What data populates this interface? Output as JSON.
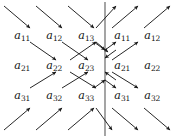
{
  "figure": {
    "width": 178,
    "height": 138,
    "background": "#ffffff",
    "ink": "#111111",
    "mirror_line_color": "#5a5a5a",
    "arrow_color": "#1a1a1a"
  },
  "mirror_line": {
    "name": "vertical mirror axis",
    "x": 105,
    "y_top": 2,
    "y_bottom": 136
  },
  "grid": {
    "column_x": [
      22,
      54,
      86,
      122,
      152
    ],
    "row_y": [
      35,
      65,
      95
    ],
    "columns_left": 3,
    "columns_right": 2
  },
  "labels": [
    {
      "id": "L-a11",
      "base": "a",
      "sub": "11",
      "x": 22,
      "y": 35,
      "side": "left"
    },
    {
      "id": "L-a12",
      "base": "a",
      "sub": "12",
      "x": 54,
      "y": 35,
      "side": "left"
    },
    {
      "id": "L-a13",
      "base": "a",
      "sub": "13",
      "x": 86,
      "y": 35,
      "side": "left"
    },
    {
      "id": "R-a11",
      "base": "a",
      "sub": "11",
      "x": 122,
      "y": 35,
      "side": "right"
    },
    {
      "id": "R-a12",
      "base": "a",
      "sub": "12",
      "x": 152,
      "y": 35,
      "side": "right"
    },
    {
      "id": "L-a21",
      "base": "a",
      "sub": "21",
      "x": 22,
      "y": 65,
      "side": "left"
    },
    {
      "id": "L-a22",
      "base": "a",
      "sub": "22",
      "x": 54,
      "y": 65,
      "side": "left"
    },
    {
      "id": "L-a23",
      "base": "a",
      "sub": "23",
      "x": 86,
      "y": 65,
      "side": "left"
    },
    {
      "id": "R-a21",
      "base": "a",
      "sub": "21",
      "x": 122,
      "y": 65,
      "side": "right"
    },
    {
      "id": "R-a22",
      "base": "a",
      "sub": "22",
      "x": 152,
      "y": 65,
      "side": "right"
    },
    {
      "id": "L-a31",
      "base": "a",
      "sub": "31",
      "x": 22,
      "y": 95,
      "side": "left"
    },
    {
      "id": "L-a32",
      "base": "a",
      "sub": "32",
      "x": 54,
      "y": 95,
      "side": "left"
    },
    {
      "id": "L-a33",
      "base": "a",
      "sub": "33",
      "x": 86,
      "y": 95,
      "side": "left"
    },
    {
      "id": "R-a31",
      "base": "a",
      "sub": "31",
      "x": 122,
      "y": 95,
      "side": "right"
    },
    {
      "id": "R-a32",
      "base": "a",
      "sub": "32",
      "x": 152,
      "y": 95,
      "side": "right"
    }
  ],
  "arrows": [
    {
      "id": "ar01",
      "x1": 4,
      "y1": 6,
      "x2": 30,
      "y2": 28,
      "dir": "SE"
    },
    {
      "id": "ar02",
      "x1": 36,
      "y1": 6,
      "x2": 62,
      "y2": 28,
      "dir": "SE"
    },
    {
      "id": "ar03",
      "x1": 68,
      "y1": 6,
      "x2": 94,
      "y2": 28,
      "dir": "SE"
    },
    {
      "id": "ar04",
      "x1": 96,
      "y1": 28,
      "x2": 116,
      "y2": 6,
      "dir": "NE"
    },
    {
      "id": "ar05",
      "x1": 112,
      "y1": 28,
      "x2": 138,
      "y2": 6,
      "dir": "NE"
    },
    {
      "id": "ar06",
      "x1": 144,
      "y1": 28,
      "x2": 170,
      "y2": 6,
      "dir": "NE"
    },
    {
      "id": "ar07",
      "x1": 30,
      "y1": 42,
      "x2": 56,
      "y2": 60,
      "dir": "SE"
    },
    {
      "id": "ar08",
      "x1": 62,
      "y1": 42,
      "x2": 88,
      "y2": 60,
      "dir": "SE"
    },
    {
      "id": "ar09",
      "x1": 94,
      "y1": 42,
      "x2": 105,
      "y2": 50,
      "dir": "SE"
    },
    {
      "id": "ar10",
      "x1": 70,
      "y1": 60,
      "x2": 96,
      "y2": 42,
      "dir": "NE"
    },
    {
      "id": "ar11",
      "x1": 105,
      "y1": 50,
      "x2": 116,
      "y2": 42,
      "dir": "NE"
    },
    {
      "id": "ar12",
      "x1": 112,
      "y1": 60,
      "x2": 138,
      "y2": 42,
      "dir": "NE"
    },
    {
      "id": "ar13",
      "x1": 116,
      "y1": 50,
      "x2": 105,
      "y2": 58,
      "dir": "SW"
    },
    {
      "id": "ar14",
      "x1": 96,
      "y1": 42,
      "x2": 108,
      "y2": 52,
      "dir": "SE"
    },
    {
      "id": "ar15",
      "x1": 30,
      "y1": 88,
      "x2": 56,
      "y2": 72,
      "dir": "NE"
    },
    {
      "id": "ar16",
      "x1": 62,
      "y1": 88,
      "x2": 88,
      "y2": 72,
      "dir": "NE"
    },
    {
      "id": "ar17",
      "x1": 94,
      "y1": 88,
      "x2": 105,
      "y2": 80,
      "dir": "NE"
    },
    {
      "id": "ar18",
      "x1": 70,
      "y1": 72,
      "x2": 96,
      "y2": 88,
      "dir": "SE"
    },
    {
      "id": "ar19",
      "x1": 105,
      "y1": 80,
      "x2": 116,
      "y2": 88,
      "dir": "SE"
    },
    {
      "id": "ar20",
      "x1": 112,
      "y1": 72,
      "x2": 138,
      "y2": 88,
      "dir": "SE"
    },
    {
      "id": "ar21",
      "x1": 116,
      "y1": 80,
      "x2": 105,
      "y2": 72,
      "dir": "NW"
    },
    {
      "id": "ar22",
      "x1": 4,
      "y1": 130,
      "x2": 30,
      "y2": 108,
      "dir": "NE"
    },
    {
      "id": "ar23",
      "x1": 36,
      "y1": 130,
      "x2": 62,
      "y2": 108,
      "dir": "NE"
    },
    {
      "id": "ar24",
      "x1": 68,
      "y1": 130,
      "x2": 94,
      "y2": 108,
      "dir": "NE"
    },
    {
      "id": "ar25",
      "x1": 96,
      "y1": 108,
      "x2": 112,
      "y2": 130,
      "dir": "SE"
    },
    {
      "id": "ar26",
      "x1": 112,
      "y1": 108,
      "x2": 138,
      "y2": 130,
      "dir": "SE"
    },
    {
      "id": "ar27",
      "x1": 144,
      "y1": 108,
      "x2": 170,
      "y2": 130,
      "dir": "SE"
    }
  ],
  "crossings": [
    {
      "id": "x1",
      "x": 105,
      "y": 48
    },
    {
      "id": "x2",
      "x": 105,
      "y": 78
    }
  ]
}
